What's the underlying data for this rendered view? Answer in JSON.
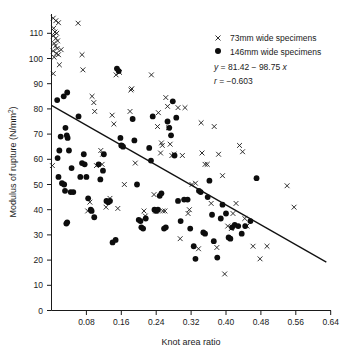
{
  "chart_data": {
    "type": "scatter",
    "title": "",
    "xlabel": "Knot area ratio",
    "ylabel": "Modulus of rupture (N/mm2)",
    "ylabel_display": "Modulus of rupture (N/mm²)",
    "xlim": [
      0.0,
      0.64
    ],
    "ylim": [
      0,
      116
    ],
    "xticks": [
      0.08,
      0.16,
      0.24,
      0.32,
      0.4,
      0.48,
      0.56,
      0.64
    ],
    "xtick_labels": [
      "0.08",
      "0.16",
      "0.24",
      "0.32",
      "0.40",
      "0.48",
      "0.56",
      "0.64"
    ],
    "yticks": [
      0,
      10,
      20,
      30,
      40,
      50,
      60,
      70,
      80,
      90,
      100,
      110
    ],
    "ytick_labels": [
      "0",
      "10",
      "20",
      "30",
      "40",
      "50",
      "60",
      "70",
      "80",
      "90",
      "100",
      "110"
    ],
    "grid": false,
    "legend_position": "top-right",
    "annotations": [
      "y = 81.42 − 98.75 x",
      "r = −0.603"
    ],
    "fit_line": {
      "slope": -98.75,
      "intercept": 81.42,
      "x_start": 0.0,
      "x_end": 0.63,
      "y_start": 81.42,
      "y_end": 19.21,
      "correlation": -0.603
    },
    "series": [
      {
        "name": "73mm wide specimens",
        "marker": "x",
        "color": "#1a1a1a",
        "points": [
          [
            0.004,
            116.0
          ],
          [
            0.01,
            115.0
          ],
          [
            0.016,
            114.2
          ],
          [
            0.005,
            112.0
          ],
          [
            0.008,
            110.5
          ],
          [
            0.012,
            110.0
          ],
          [
            0.004,
            109.0
          ],
          [
            0.01,
            108.0
          ],
          [
            0.014,
            107.0
          ],
          [
            0.006,
            106.0
          ],
          [
            0.009,
            105.0
          ],
          [
            0.013,
            104.0
          ],
          [
            0.004,
            103.0
          ],
          [
            0.011,
            102.0
          ],
          [
            0.016,
            101.5
          ],
          [
            0.006,
            100.5
          ],
          [
            0.004,
            94.0
          ],
          [
            0.018,
            97.5
          ],
          [
            0.022,
            103.5
          ],
          [
            0.061,
            114.0
          ],
          [
            0.07,
            101.5
          ],
          [
            0.072,
            95.5
          ],
          [
            0.093,
            85.0
          ],
          [
            0.097,
            82.5
          ],
          [
            0.099,
            79.0
          ],
          [
            0.113,
            63.5
          ],
          [
            0.117,
            62.0
          ],
          [
            0.116,
            58.0
          ],
          [
            0.125,
            41.0
          ],
          [
            0.139,
            77.5
          ],
          [
            0.143,
            74.0
          ],
          [
            0.148,
            93.5
          ],
          [
            0.156,
            94.5
          ],
          [
            0.161,
            65.5
          ],
          [
            0.167,
            50.0
          ],
          [
            0.18,
            79.0
          ],
          [
            0.182,
            87.5
          ],
          [
            0.184,
            88.0
          ],
          [
            0.192,
            58.5
          ],
          [
            0.229,
            93.5
          ],
          [
            0.245,
            78.5
          ],
          [
            0.243,
            73.0
          ],
          [
            0.252,
            66.5
          ],
          [
            0.254,
            65.5
          ],
          [
            0.25,
            62.5
          ],
          [
            0.262,
            84.5
          ],
          [
            0.266,
            81.0
          ],
          [
            0.268,
            72.5
          ],
          [
            0.272,
            66.0
          ],
          [
            0.276,
            61.5
          ],
          [
            0.281,
            62.0
          ],
          [
            0.29,
            80.5
          ],
          [
            0.306,
            80.5
          ],
          [
            0.3,
            61.5
          ],
          [
            0.295,
            28.5
          ],
          [
            0.313,
            38.5
          ],
          [
            0.316,
            40.0
          ],
          [
            0.322,
            50.0
          ],
          [
            0.33,
            50.5
          ],
          [
            0.337,
            24.5
          ],
          [
            0.343,
            74.5
          ],
          [
            0.345,
            62.5
          ],
          [
            0.352,
            58.0
          ],
          [
            0.357,
            58.0
          ],
          [
            0.366,
            42.5
          ],
          [
            0.373,
            73.0
          ],
          [
            0.379,
            25.0
          ],
          [
            0.383,
            62.0
          ],
          [
            0.392,
            53.5
          ],
          [
            0.397,
            14.5
          ],
          [
            0.404,
            33.5
          ],
          [
            0.412,
            32.5
          ],
          [
            0.416,
            38.5
          ],
          [
            0.423,
            42.5
          ],
          [
            0.431,
            65.5
          ],
          [
            0.438,
            63.0
          ],
          [
            0.443,
            36.5
          ],
          [
            0.448,
            33.5
          ],
          [
            0.462,
            25.5
          ],
          [
            0.478,
            20.5
          ],
          [
            0.494,
            25.5
          ],
          [
            0.54,
            49.5
          ],
          [
            0.556,
            41.0
          ],
          [
            0.215,
            37.5
          ],
          [
            0.212,
            39.5
          ],
          [
            0.235,
            46.0
          ],
          [
            0.239,
            39.5
          ],
          [
            0.152,
            40.5
          ],
          [
            0.134,
            44.5
          ],
          [
            0.103,
            57.5
          ],
          [
            0.088,
            43.0
          ],
          [
            0.083,
            39.5
          ],
          [
            0.002,
            57.5
          ],
          [
            0.255,
            39.5
          ],
          [
            0.26,
            39.5
          ]
        ]
      },
      {
        "name": "146mm wide specimens",
        "marker": "o",
        "color": "#0d0d0d",
        "points": [
          [
            0.013,
            83.5
          ],
          [
            0.028,
            85.0
          ],
          [
            0.036,
            86.5
          ],
          [
            0.021,
            69.0
          ],
          [
            0.032,
            72.5
          ],
          [
            0.035,
            69.5
          ],
          [
            0.037,
            68.5
          ],
          [
            0.04,
            63.5
          ],
          [
            0.018,
            63.5
          ],
          [
            0.014,
            60.5
          ],
          [
            0.016,
            53.0
          ],
          [
            0.024,
            50.5
          ],
          [
            0.029,
            50.0
          ],
          [
            0.031,
            47.5
          ],
          [
            0.044,
            47.0
          ],
          [
            0.034,
            34.5
          ],
          [
            0.036,
            35.0
          ],
          [
            0.062,
            77.0
          ],
          [
            0.07,
            58.5
          ],
          [
            0.074,
            62.0
          ],
          [
            0.08,
            53.0
          ],
          [
            0.084,
            44.5
          ],
          [
            0.09,
            40.0
          ],
          [
            0.092,
            39.5
          ],
          [
            0.098,
            37.0
          ],
          [
            0.108,
            58.0
          ],
          [
            0.112,
            52.0
          ],
          [
            0.118,
            55.5
          ],
          [
            0.126,
            43.5
          ],
          [
            0.13,
            43.0
          ],
          [
            0.134,
            43.5
          ],
          [
            0.14,
            27.0
          ],
          [
            0.147,
            28.0
          ],
          [
            0.15,
            96.0
          ],
          [
            0.154,
            95.0
          ],
          [
            0.158,
            68.5
          ],
          [
            0.16,
            65.5
          ],
          [
            0.164,
            65.0
          ],
          [
            0.186,
            76.0
          ],
          [
            0.19,
            67.5
          ],
          [
            0.196,
            50.0
          ],
          [
            0.2,
            36.0
          ],
          [
            0.204,
            35.5
          ],
          [
            0.206,
            33.0
          ],
          [
            0.21,
            32.5
          ],
          [
            0.216,
            36.5
          ],
          [
            0.224,
            64.5
          ],
          [
            0.228,
            59.5
          ],
          [
            0.232,
            77.0
          ],
          [
            0.236,
            40.0
          ],
          [
            0.24,
            39.5
          ],
          [
            0.244,
            40.0
          ],
          [
            0.248,
            45.5
          ],
          [
            0.252,
            46.5
          ],
          [
            0.258,
            32.5
          ],
          [
            0.262,
            33.0
          ],
          [
            0.266,
            75.0
          ],
          [
            0.27,
            72.5
          ],
          [
            0.274,
            69.5
          ],
          [
            0.278,
            83.0
          ],
          [
            0.282,
            61.5
          ],
          [
            0.286,
            76.5
          ],
          [
            0.29,
            43.5
          ],
          [
            0.296,
            35.5
          ],
          [
            0.304,
            44.0
          ],
          [
            0.312,
            44.0
          ],
          [
            0.318,
            32.5
          ],
          [
            0.326,
            25.5
          ],
          [
            0.33,
            20.5
          ],
          [
            0.338,
            47.5
          ],
          [
            0.342,
            47.0
          ],
          [
            0.348,
            31.0
          ],
          [
            0.352,
            30.5
          ],
          [
            0.358,
            45.0
          ],
          [
            0.362,
            51.5
          ],
          [
            0.368,
            38.0
          ],
          [
            0.372,
            27.5
          ],
          [
            0.38,
            21.0
          ],
          [
            0.388,
            36.5
          ],
          [
            0.392,
            42.0
          ],
          [
            0.4,
            38.5
          ],
          [
            0.406,
            29.0
          ],
          [
            0.41,
            28.5
          ],
          [
            0.414,
            33.0
          ],
          [
            0.42,
            34.0
          ],
          [
            0.428,
            33.5
          ],
          [
            0.436,
            30.5
          ],
          [
            0.444,
            33.5
          ],
          [
            0.456,
            35.5
          ],
          [
            0.47,
            52.5
          ],
          [
            0.12,
            62.0
          ],
          [
            0.076,
            58.0
          ],
          [
            0.066,
            53.0
          ],
          [
            0.046,
            56.5
          ],
          [
            0.05,
            47.0
          ]
        ]
      }
    ]
  },
  "legend": {
    "entries": [
      {
        "marker": "x",
        "label": "73mm wide specimens"
      },
      {
        "marker": "dot",
        "label": "146mm wide specimens"
      }
    ],
    "equation_y": "y",
    "equation_body": " = 81.42 − 98.75 ",
    "equation_x": "x",
    "correlation_r": "r",
    "correlation_body": " = −0.603"
  },
  "axes": {
    "x_title": "Knot area ratio",
    "y_title_main": "Modulus of rupture (N/mm",
    "y_title_sup": "2",
    "y_title_close": ")"
  }
}
